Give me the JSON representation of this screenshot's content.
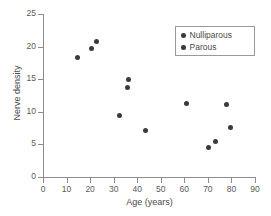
{
  "chart_data": {
    "type": "scatter",
    "title": "",
    "xlabel": "Age (years)",
    "ylabel": "Nerve density",
    "xlim": [
      0,
      90
    ],
    "ylim": [
      0,
      25
    ],
    "xticks": [
      0,
      10,
      20,
      30,
      40,
      50,
      60,
      70,
      80,
      90
    ],
    "yticks": [
      0,
      5,
      10,
      15,
      20,
      25
    ],
    "grid": false,
    "legend_position": "top-right",
    "marker_color": "#3a3a3a",
    "axis_color": "#8c8c8c",
    "series": [
      {
        "name": "Nulliparous",
        "marker": "filled-circle",
        "color": "#3a3a3a",
        "points": []
      },
      {
        "name": "Parous",
        "marker": "filled-circle",
        "color": "#3a3a3a",
        "points": []
      }
    ],
    "points": [
      {
        "x": 14.8,
        "y": 18.4
      },
      {
        "x": 20.5,
        "y": 19.7
      },
      {
        "x": 22.8,
        "y": 20.8
      },
      {
        "x": 32.5,
        "y": 9.4
      },
      {
        "x": 36.0,
        "y": 13.7
      },
      {
        "x": 36.5,
        "y": 14.9
      },
      {
        "x": 43.5,
        "y": 7.2
      },
      {
        "x": 61.0,
        "y": 11.2
      },
      {
        "x": 70.3,
        "y": 4.6
      },
      {
        "x": 73.3,
        "y": 5.4
      },
      {
        "x": 78.0,
        "y": 11.1
      },
      {
        "x": 79.6,
        "y": 7.6
      }
    ]
  },
  "legend": {
    "entries": [
      {
        "label": "Nulliparous"
      },
      {
        "label": "Parous"
      }
    ]
  }
}
